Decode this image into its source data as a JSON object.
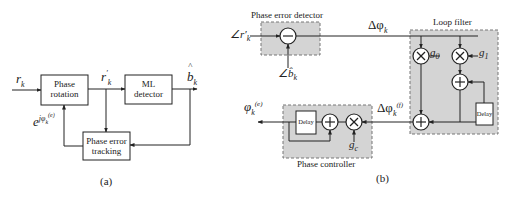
{
  "figure_a": {
    "caption": "(a)",
    "input_label": "r",
    "input_sub": "k",
    "rotated_label": "r",
    "rotated_sup": "′",
    "rotated_sub": "k",
    "output_label": "b",
    "output_hat": "^",
    "output_sub": "k",
    "feedback_label": "e",
    "feedback_sup": "jφ",
    "feedback_sup_sub": "k",
    "feedback_sup_sup": "(e)",
    "blocks": {
      "phase_rotation": [
        "Phase",
        "rotation"
      ],
      "ml_detector": [
        "ML",
        "detector"
      ],
      "phase_error_tracking": [
        "Phase error",
        "tracking"
      ]
    }
  },
  "figure_b": {
    "caption": "(b)",
    "phase_error_detector": {
      "title": "Phase error detector",
      "input_top": "∠r′",
      "input_top_sub": "k",
      "input_bottom": "∠b̂",
      "input_bottom_sub": "k",
      "op": "−"
    },
    "delta_phi": "Δφ",
    "delta_phi_sub": "k",
    "loop_filter": {
      "title": "Loop filter",
      "g0": "g",
      "g0_sub": "0",
      "g1": "g",
      "g1_sub": "1",
      "delay": "Delay"
    },
    "filtered": "Δφ",
    "filtered_sub": "k",
    "filtered_sup": "(f)",
    "phase_controller": {
      "title": "Phase controller",
      "gc": "g",
      "gc_sub": "c",
      "delay": "Delay"
    },
    "output": "φ",
    "output_sub": "k",
    "output_sup": "(e)",
    "colors": {
      "block_fill": "#d4d4d4",
      "dashed_border": "#777777",
      "line": "#222222"
    }
  }
}
